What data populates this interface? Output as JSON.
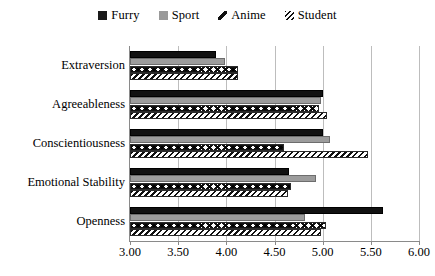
{
  "legend": {
    "position": "top-center",
    "items": [
      {
        "label": "Furry",
        "swatch": "filled-square-black-icon",
        "color": "#111111"
      },
      {
        "label": "Sport",
        "swatch": "filled-square-gray-icon",
        "color": "#9c9c9c"
      },
      {
        "label": "Anime",
        "swatch": "diagonal-line-icon",
        "color": "#111111"
      },
      {
        "label": "Student",
        "swatch": "hatched-square-icon",
        "color": "#111111"
      }
    ]
  },
  "axis": {
    "x_ticks": [
      "3.00",
      "3.50",
      "4.00",
      "4.50",
      "5.00",
      "5.50",
      "6.00"
    ],
    "y_categories": [
      "Extraversion",
      "Agreeableness",
      "Conscientiousness",
      "Emotional Stability",
      "Openness"
    ]
  },
  "chart_data": {
    "type": "bar",
    "orientation": "horizontal",
    "title": "",
    "subtitle": "",
    "xlabel": "",
    "ylabel": "",
    "xlim": [
      3.0,
      6.0
    ],
    "xtick_step": 0.5,
    "grid": "vertical",
    "legend_position": "top-center",
    "categories": [
      "Extraversion",
      "Agreeableness",
      "Conscientiousness",
      "Emotional Stability",
      "Openness"
    ],
    "series": [
      {
        "name": "Furry",
        "color": "#111111",
        "pattern": "solid-black",
        "values": [
          3.89,
          5.0,
          5.0,
          4.65,
          5.63
        ]
      },
      {
        "name": "Sport",
        "color": "#9c9c9c",
        "pattern": "solid-gray",
        "values": [
          3.99,
          4.98,
          5.08,
          4.93,
          4.82
        ]
      },
      {
        "name": "Anime",
        "color": "#111111",
        "pattern": "chevron",
        "values": [
          4.12,
          4.96,
          4.6,
          4.67,
          5.03
        ]
      },
      {
        "name": "Student",
        "color": "#111111",
        "pattern": "diagonal-hatch",
        "values": [
          4.12,
          5.05,
          5.47,
          4.64,
          4.98
        ]
      }
    ]
  }
}
